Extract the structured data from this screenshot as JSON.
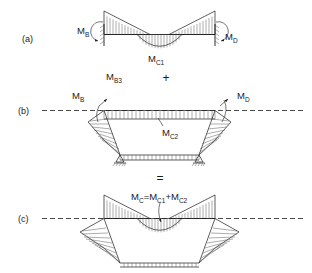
{
  "figure": {
    "panels": [
      {
        "id": "a",
        "label": "(a)",
        "description": "Fixed-end beam bending moment diagram",
        "labels": {
          "left_moment": "M",
          "left_moment_sub": "B",
          "right_moment": "M",
          "right_moment_sub": "D",
          "mid_moment": "M",
          "mid_moment_sub": "C1"
        }
      },
      {
        "id": "b",
        "label": "(b)",
        "description": "Portal frame sway moment diagram with pinned bases",
        "labels": {
          "left_moment": "M",
          "left_moment_sub": "B",
          "right_moment": "M",
          "right_moment_sub": "D",
          "mid_moment": "M",
          "mid_moment_sub": "C2"
        }
      },
      {
        "id": "c",
        "label": "(c)",
        "description": "Combined resultant bending moment diagram",
        "labels": {
          "equation_m": "M",
          "equation_m_sub": "C",
          "equation_eq": "=M",
          "equation_sub1": "C1",
          "equation_plus": "+M",
          "equation_sub2": "C2"
        }
      }
    ],
    "annotations": {
      "mb3": "M",
      "mb3_sub": "B3",
      "plus_operator": "+",
      "equals_operator": "="
    },
    "colors": {
      "ink": "#1a1a1a",
      "hatch": "#5a5a5a",
      "background": "#ffffff"
    }
  }
}
